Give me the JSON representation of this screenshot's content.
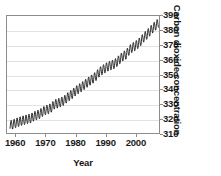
{
  "chart_data": {
    "type": "line",
    "title": "",
    "subtitle": "",
    "xlabel": "Year",
    "ylabel": "Carbon dioxide concentration",
    "xlim": [
      1957,
      2008
    ],
    "ylim": [
      310,
      390
    ],
    "xticks": [
      1960,
      1970,
      1980,
      1990,
      2000
    ],
    "yticks": [
      310,
      320,
      330,
      340,
      350,
      360,
      370,
      380,
      390
    ],
    "grid": "horizontal",
    "legend": "none",
    "line_color": "#1a1a1a",
    "series": [
      {
        "name": "Atmospheric CO2 (Mauna Loa)",
        "note": "annual sawtooth seasonal cycle superimposed on rising trend",
        "seasonal_amplitude_ppm": 3.2,
        "x": [
          1958,
          1959,
          1960,
          1961,
          1962,
          1963,
          1964,
          1965,
          1966,
          1967,
          1968,
          1969,
          1970,
          1971,
          1972,
          1973,
          1974,
          1975,
          1976,
          1977,
          1978,
          1979,
          1980,
          1981,
          1982,
          1983,
          1984,
          1985,
          1986,
          1987,
          1988,
          1989,
          1990,
          1991,
          1992,
          1993,
          1994,
          1995,
          1996,
          1997,
          1998,
          1999,
          2000,
          2001,
          2002,
          2003,
          2004,
          2005,
          2006,
          2007
        ],
        "values": [
          315.3,
          315.9,
          316.9,
          317.6,
          318.4,
          318.9,
          319.6,
          320.0,
          321.4,
          322.2,
          323.0,
          324.6,
          325.7,
          326.3,
          327.5,
          329.7,
          330.2,
          331.1,
          332.0,
          333.8,
          335.4,
          336.8,
          338.7,
          340.1,
          341.4,
          343.0,
          344.6,
          346.0,
          347.4,
          349.2,
          351.6,
          353.1,
          354.4,
          355.6,
          356.4,
          357.1,
          358.8,
          360.8,
          362.6,
          363.7,
          366.6,
          368.3,
          369.5,
          371.0,
          373.1,
          375.6,
          377.4,
          379.6,
          381.8,
          383.7
        ]
      }
    ]
  },
  "axes": {
    "y_title": "Carbon dioxide concentration",
    "x_title": "Year",
    "y_tick_labels": [
      "390",
      "380",
      "370",
      "360",
      "350",
      "340",
      "330",
      "320",
      "310"
    ],
    "x_tick_labels": [
      "1960",
      "1970",
      "1980",
      "1990",
      "2000"
    ]
  }
}
